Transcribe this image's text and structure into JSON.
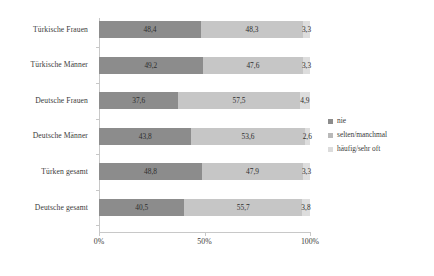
{
  "chart_data": {
    "type": "bar",
    "subtype": "horizontal-stacked-100pct",
    "title": "",
    "xlabel": "",
    "ylabel": "",
    "xlim": [
      0,
      100
    ],
    "xticks": [
      "0%",
      "50%",
      "100%"
    ],
    "xtick_values": [
      0,
      50,
      100
    ],
    "grid": false,
    "legend_position": "right",
    "orientation": "horizontal",
    "categories": [
      "Türkische Frauen",
      "Türkische Männer",
      "Deutsche Frauen",
      "Deutsche Männer",
      "Türken gesamt",
      "Deutsche gesamt"
    ],
    "series": [
      {
        "name": "nie",
        "color": "#8c8c8c",
        "values": [
          48.4,
          49.2,
          37.6,
          43.8,
          48.8,
          40.5
        ],
        "labels": [
          "48,4",
          "49,2",
          "37,6",
          "43,8",
          "48,8",
          "40,5"
        ]
      },
      {
        "name": "selten/manchmal",
        "color": "#c6c6c6",
        "values": [
          48.3,
          47.6,
          57.5,
          53.6,
          47.9,
          55.7
        ],
        "labels": [
          "48,3",
          "47,6",
          "57,5",
          "53,6",
          "47,9",
          "55,7"
        ]
      },
      {
        "name": "häufig/sehr oft",
        "color": "#dddddd",
        "values": [
          3.3,
          3.3,
          4.9,
          2.6,
          3.3,
          3.8
        ],
        "labels": [
          "3,3",
          "3,3",
          "4,9",
          "2,6",
          "3,3",
          "3,8"
        ]
      }
    ]
  },
  "legend": {
    "items": [
      {
        "label": "nie",
        "swatch_class": "sw-nie"
      },
      {
        "label": "selten/manchmal",
        "swatch_class": "sw-selten"
      },
      {
        "label": "häufig/sehr oft",
        "swatch_class": "sw-haeufig"
      }
    ]
  },
  "colors": {
    "nie": "#8c8c8c",
    "selten_manchmal": "#c6c6c6",
    "haeufig_sehr_oft": "#dddddd",
    "axis": "#c8c8c8",
    "text": "#3a3a3a",
    "background": "#ffffff"
  }
}
